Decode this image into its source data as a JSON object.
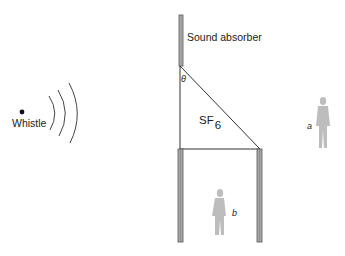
{
  "diagram": {
    "labels": {
      "source": "Whistle",
      "absorber": "Sound absorber",
      "gas": "SF",
      "gas_subscript": "6",
      "angle": "θ",
      "listener_a": "a",
      "listener_b": "b"
    },
    "colors": {
      "line": "#333333",
      "post_fill": "#9a9a9a",
      "person": "#bdbdbd",
      "text": "#222222"
    }
  }
}
